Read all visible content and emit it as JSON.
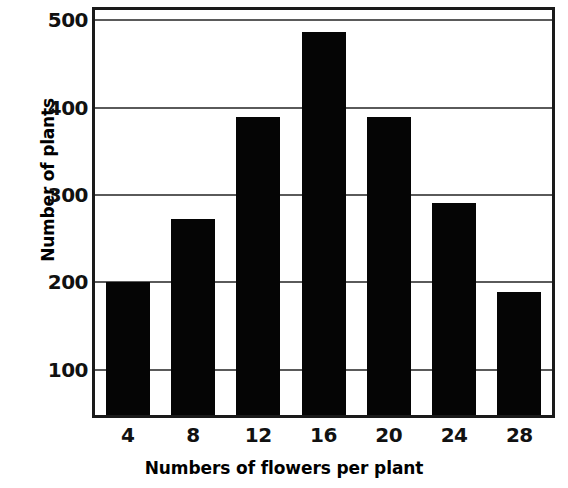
{
  "chart_data": {
    "type": "bar",
    "title": "",
    "xlabel": "Numbers of flowers per plant",
    "ylabel": "Number of plants",
    "categories": [
      "4",
      "8",
      "12",
      "16",
      "20",
      "24",
      "28"
    ],
    "values": [
      200,
      272,
      390,
      487,
      390,
      291,
      189
    ],
    "series": [
      {
        "name": "Number of plants",
        "values": [
          200,
          272,
          390,
          487,
          390,
          291,
          189
        ]
      }
    ],
    "xlim": [
      2,
      30
    ],
    "ylim": [
      48,
      512
    ],
    "ytick_labels": [
      "500",
      "400",
      "300",
      "200",
      "100"
    ],
    "ytick_values": [
      500,
      400,
      300,
      200,
      100
    ],
    "xtick_labels": [
      "4",
      "8",
      "12",
      "16",
      "20",
      "24",
      "28"
    ],
    "grid": "horizontal",
    "legend": "none",
    "bar_color": "#050505",
    "frame_color": "#1a1a1a",
    "gridline_color": "#5a5a5a",
    "background_color": "#ffffff"
  }
}
